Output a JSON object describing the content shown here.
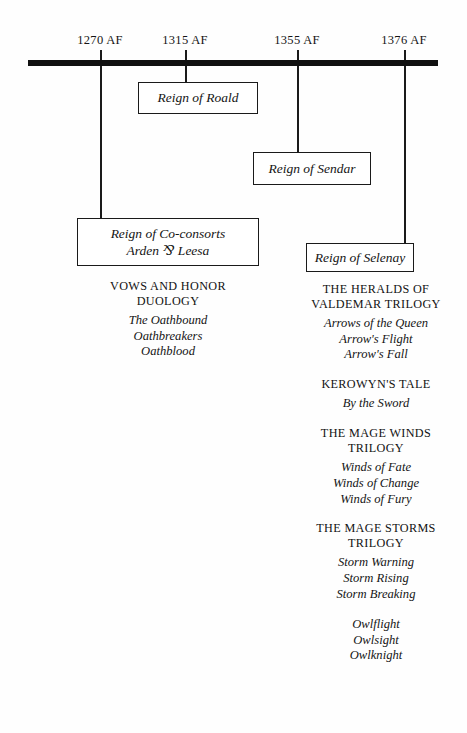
{
  "timeline": {
    "dates": [
      {
        "label": "1270 AF",
        "x": 100
      },
      {
        "label": "1315 AF",
        "x": 185
      },
      {
        "label": "1355 AF",
        "x": 297
      },
      {
        "label": "1376 AF",
        "x": 404
      }
    ]
  },
  "reigns": [
    {
      "name": "reign-of-roald",
      "line1": "Reign of Roald",
      "line2": ""
    },
    {
      "name": "reign-of-sendar",
      "line1": "Reign of Sendar",
      "line2": ""
    },
    {
      "name": "reign-of-co-consorts",
      "line1": "Reign of Co-consorts",
      "line2": "Arden ⅋ Leesa"
    },
    {
      "name": "reign-of-selenay",
      "line1": "Reign of Selenay",
      "line2": ""
    }
  ],
  "left_column": {
    "series": [
      {
        "heading_line1": "VOWS AND HONOR",
        "heading_line2": "DUOLOGY",
        "books": [
          "The Oathbound",
          "Oathbreakers",
          "Oathblood"
        ]
      }
    ]
  },
  "right_column": {
    "series": [
      {
        "heading_line1": "THE  HERALDS OF",
        "heading_line2": "VALDEMAR TRILOGY",
        "books": [
          "Arrows of the Queen",
          "Arrow's Flight",
          "Arrow's Fall"
        ]
      },
      {
        "heading_line1": "KEROWYN'S TALE",
        "heading_line2": "",
        "books": [
          "By the Sword"
        ]
      },
      {
        "heading_line1": "THE MAGE WINDS",
        "heading_line2": "TRILOGY",
        "books": [
          "Winds of Fate",
          "Winds of Change",
          "Winds of Fury"
        ]
      },
      {
        "heading_line1": "THE MAGE STORMS",
        "heading_line2": "TRILOGY",
        "books": [
          "Storm Warning",
          "Storm Rising",
          "Storm Breaking"
        ]
      },
      {
        "heading_line1": "",
        "heading_line2": "",
        "books": [
          "Owlflight",
          "Owlsight",
          "Owlknight"
        ]
      }
    ]
  }
}
